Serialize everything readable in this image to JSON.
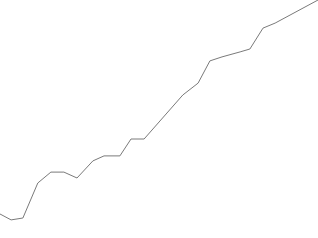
{
  "chart_data": {
    "type": "line",
    "title": "",
    "xlabel": "",
    "ylabel": "",
    "grid": false,
    "legend": "none",
    "xlim": [
      0,
      100
    ],
    "ylim": [
      0,
      100
    ],
    "series": [
      {
        "name": "series-1",
        "color": "#7a7a7a",
        "x": [
          0,
          3.5,
          7.2,
          11.9,
          16.0,
          20.1,
          24.2,
          29.2,
          32.7,
          37.7,
          41.2,
          45.3,
          57.5,
          62.3,
          66.0,
          69.8,
          75.5,
          78.6,
          82.7,
          86.5,
          100
        ],
        "values": [
          10.1,
          7.6,
          8.4,
          23.1,
          27.7,
          27.7,
          25.2,
          32.4,
          34.5,
          34.5,
          41.6,
          41.6,
          60.1,
          65.1,
          74.4,
          76.1,
          78.2,
          79.4,
          88.2,
          90.3,
          100
        ]
      }
    ]
  }
}
